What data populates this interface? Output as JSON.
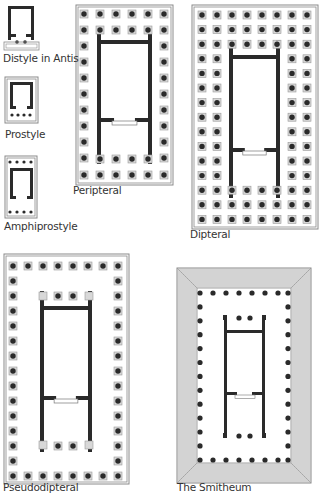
{
  "diagram": {
    "colors": {
      "ink": "#2a2a2a",
      "frame": "#8a8a8a",
      "fill": "#ffffff",
      "hatch": "#9a9a9a"
    },
    "plans": [
      {
        "id": "distyle-in-antis",
        "label": "Distyle in Antis",
        "label_x": 3,
        "label_y": 60
      },
      {
        "id": "prostyle",
        "label": "Prostyle",
        "label_x": 5,
        "label_y": 136
      },
      {
        "id": "amphiprostyle",
        "label": "Amphiprostyle",
        "label_x": 4,
        "label_y": 228
      },
      {
        "id": "peripteral",
        "label": "Peripteral",
        "label_x": 73,
        "label_y": 192
      },
      {
        "id": "dipteral",
        "label": "Dipteral",
        "label_x": 190,
        "label_y": 236
      },
      {
        "id": "pseudodipteral",
        "label": "Pseudodipteral",
        "label_x": 3,
        "label_y": 489
      },
      {
        "id": "smitheum",
        "label": "The Smitheum",
        "label_x": 177,
        "label_y": 489
      }
    ]
  }
}
